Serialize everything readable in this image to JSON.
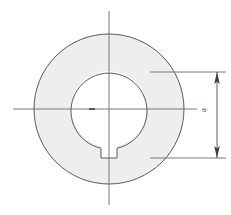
{
  "drawing": {
    "title": "Annular ring with keyway cross-section",
    "background_color": "#ffffff",
    "line_color": "#5a5a5a",
    "centerline_color": "#6b6b6b",
    "fill_color": "#eeeeee",
    "dimension_color": "#4a4a4a"
  },
  "geometry": {
    "center": {
      "x": 109,
      "y": 109
    },
    "outer_circle": {
      "name": "outer-diameter",
      "radius": 75,
      "top_y": 34,
      "bottom_y": 184,
      "left_x": 34,
      "right_x": 184
    },
    "bore_circle": {
      "name": "bore-diameter",
      "radius": 38,
      "top_y": 71,
      "bottom_y": 147,
      "left_x": 71,
      "right_x": 147
    },
    "keyway": {
      "name": "keyway-notch",
      "width": 16,
      "left_x": 101,
      "right_x": 117,
      "bottom_y": 158,
      "top_y": 144
    }
  },
  "centerlines": {
    "horizontal": {
      "label": "horizontal-centerline",
      "y": 109,
      "x_start": 13,
      "x_end": 197
    },
    "vertical": {
      "label": "vertical-centerline",
      "x": 109,
      "y_start": 11,
      "y_end": 205
    },
    "center_mark": {
      "label": "center-mark",
      "x": 92,
      "y": 109
    }
  },
  "dimension": {
    "label": "a",
    "name": "dimension-a",
    "orientation": "vertical",
    "line_x": 217,
    "top_y": 72,
    "bottom_y": 158,
    "extension_lines": [
      {
        "name": "extension-line-top",
        "y": 72,
        "x_start": 150,
        "x_end": 226
      },
      {
        "name": "extension-line-bottom",
        "y": 158,
        "x_start": 150,
        "x_end": 226
      }
    ],
    "arrowheads": [
      {
        "name": "arrowhead-top",
        "direction": "up",
        "x": 217,
        "y": 74
      },
      {
        "name": "arrowhead-bottom",
        "direction": "down",
        "x": 217,
        "y": 156
      }
    ]
  }
}
